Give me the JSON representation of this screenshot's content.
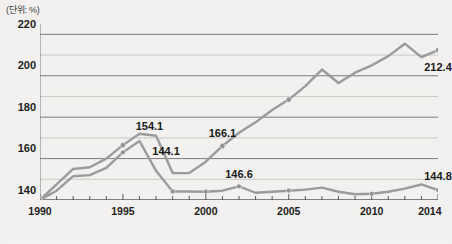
{
  "unit_label": "(단위: %)",
  "colors": {
    "background": "#f2f1ef",
    "line": "#9b9b9b",
    "marker": "#8f8f8f",
    "grid": "#b9b8b5",
    "axis": "#6e6e6e",
    "text": "#1a1a1a"
  },
  "chart_data": {
    "type": "line",
    "title": "",
    "subtitle": "",
    "xlabel": "",
    "ylabel": "(단위: %)",
    "xlim": [
      1990,
      2014
    ],
    "ylim": [
      140,
      225
    ],
    "grid": true,
    "legend": "none",
    "yticks": [
      140,
      160,
      180,
      200,
      220
    ],
    "ygridlines": [
      140,
      150,
      160,
      170,
      180,
      190,
      200,
      210,
      220
    ],
    "xticks": [
      1990,
      1995,
      2000,
      2005,
      2010,
      2014
    ],
    "x": [
      1990,
      1991,
      1992,
      1993,
      1994,
      1995,
      1996,
      1997,
      1998,
      1999,
      2000,
      2001,
      2002,
      2003,
      2004,
      2005,
      2006,
      2007,
      2008,
      2009,
      2010,
      2011,
      2012,
      2013,
      2014
    ],
    "series": [
      {
        "name": "upper",
        "values": [
          140.0,
          147.5,
          155.0,
          155.8,
          160.0,
          166.5,
          172.0,
          171.0,
          153.0,
          153.0,
          158.5,
          166.1,
          172.5,
          177.5,
          183.5,
          188.5,
          195.0,
          203.0,
          196.5,
          201.5,
          205.0,
          209.5,
          215.5,
          209.0,
          212.4
        ],
        "markers": [
          {
            "x": 1990,
            "y": 140.0
          },
          {
            "x": 1995,
            "y": 166.5
          },
          {
            "x": 2001,
            "y": 166.1
          },
          {
            "x": 2005,
            "y": 188.5
          },
          {
            "x": 2014,
            "y": 212.4
          }
        ],
        "labels": [
          {
            "x": 2001,
            "y": 166.1,
            "text": "166.1"
          },
          {
            "x": 2014,
            "y": 212.4,
            "text": "212.4"
          }
        ]
      },
      {
        "name": "lower",
        "values": [
          140.0,
          144.5,
          151.5,
          152.0,
          155.5,
          163.0,
          168.5,
          154.1,
          144.1,
          144.1,
          144.0,
          144.5,
          146.6,
          143.5,
          144.0,
          144.5,
          145.0,
          146.0,
          144.0,
          142.8,
          143.0,
          144.0,
          145.5,
          147.5,
          144.8
        ]
      }
    ],
    "annotations": [
      {
        "text": "154.1",
        "x": 1996.6,
        "y": 175.5
      },
      {
        "text": "144.1",
        "x": 1997.6,
        "y": 163.5
      },
      {
        "text": "166.1",
        "x": 2001.0,
        "y": 172.5
      },
      {
        "text": "146.6",
        "x": 2002.0,
        "y": 152.5
      },
      {
        "text": "212.4",
        "x": 2014.0,
        "y": 204.0
      },
      {
        "text": "144.8",
        "x": 2014.0,
        "y": 151.5
      }
    ]
  },
  "axis_text": {
    "yticks": [
      "220",
      "200",
      "180",
      "160",
      "140"
    ],
    "xticks": [
      "1990",
      "1995",
      "2000",
      "2005",
      "2010",
      "2014"
    ]
  },
  "callouts": {
    "a_154_1": "154.1",
    "a_144_1": "144.1",
    "a_166_1": "166.1",
    "a_146_6": "146.6",
    "a_212_4": "212.4",
    "a_144_8": "144.8"
  }
}
